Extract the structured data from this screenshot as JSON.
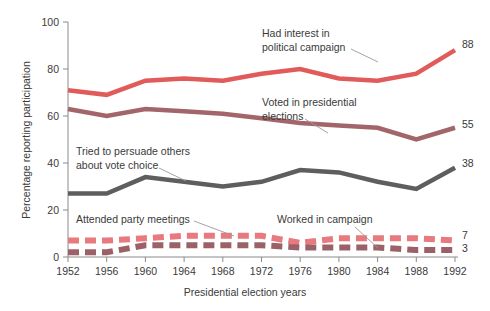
{
  "chart_data": {
    "type": "line",
    "title": "",
    "xlabel": "Presidential election years",
    "ylabel": "Percentage reporting participation",
    "categories": [
      "1952",
      "1956",
      "1960",
      "1964",
      "1968",
      "1972",
      "1976",
      "1980",
      "1984",
      "1988",
      "1992"
    ],
    "xlim": [
      1952,
      1992
    ],
    "ylim": [
      0,
      100
    ],
    "yticks": [
      "0",
      "20",
      "40",
      "60",
      "80",
      "100"
    ],
    "grid": false,
    "legend": "annotations-on-plot",
    "series": [
      {
        "name": "Had interest in political campaign",
        "color": "#e25b5b",
        "style": "solid",
        "end_value": "88",
        "values": [
          71,
          69,
          75,
          76,
          75,
          78,
          80,
          76,
          75,
          78,
          88
        ]
      },
      {
        "name": "Voted in presidential elections",
        "color": "#a2666a",
        "style": "solid",
        "end_value": "55",
        "values": [
          63,
          60,
          63,
          62,
          61,
          59,
          57,
          56,
          55,
          50,
          55
        ]
      },
      {
        "name": "Tried to persuade others about vote choice",
        "color": "#5e5e5e",
        "style": "solid",
        "end_value": "38",
        "values": [
          27,
          27,
          34,
          32,
          30,
          32,
          37,
          36,
          32,
          29,
          38
        ]
      },
      {
        "name": "Attended party meetings",
        "color": "#e8797e",
        "style": "dashed",
        "end_value": "7",
        "values": [
          7,
          7,
          8,
          9,
          9,
          9,
          6,
          8,
          8,
          8,
          7
        ]
      },
      {
        "name": "Worked in campaign",
        "color": "#9a6268",
        "style": "dashed",
        "end_value": "3",
        "values": [
          2,
          2,
          5,
          5,
          5,
          5,
          4,
          4,
          4,
          3,
          3
        ]
      }
    ],
    "annotations": [
      {
        "id": "had-interest",
        "lines": [
          "Had interest in",
          "political campaign"
        ]
      },
      {
        "id": "voted",
        "lines": [
          "Voted in presidential",
          "elections"
        ]
      },
      {
        "id": "persuade",
        "lines": [
          "Tried to persuade others",
          "about vote choice"
        ]
      },
      {
        "id": "attended",
        "lines": [
          "Attended party meetings"
        ]
      },
      {
        "id": "worked",
        "lines": [
          "Worked in campaign"
        ]
      }
    ]
  }
}
